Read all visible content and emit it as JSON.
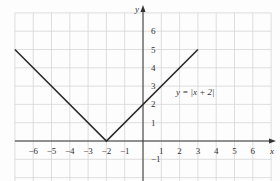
{
  "chart_data": {
    "type": "line",
    "title": "",
    "xlabel": "x",
    "ylabel": "y",
    "xlim": [
      -7,
      7
    ],
    "ylim": [
      -2,
      7
    ],
    "grid": true,
    "x_ticks": [
      -6,
      -5,
      -4,
      -3,
      -2,
      -1,
      1,
      2,
      3,
      4,
      5,
      6
    ],
    "y_ticks": [
      -1,
      1,
      2,
      3,
      4,
      5,
      6
    ],
    "series": [
      {
        "name": "y = |x + 2|",
        "x": [
          -7,
          -2,
          3
        ],
        "y": [
          5,
          0,
          5
        ]
      }
    ],
    "annotations": [
      {
        "text": "y = |x + 2|",
        "x": 1.8,
        "y": 2.5
      }
    ]
  },
  "labels": {
    "x_axis": "x",
    "y_axis": "y",
    "equation": "y = |x + 2|"
  },
  "colors": {
    "grid": "#d6d6d6",
    "axis": "#333333",
    "curve": "#2b2b2b"
  }
}
